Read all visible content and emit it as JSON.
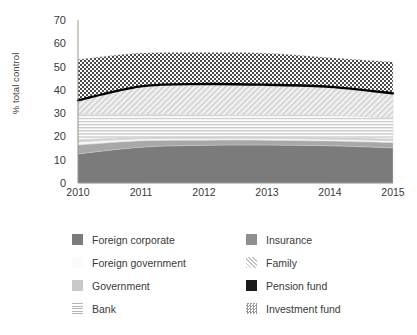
{
  "chart_data": {
    "type": "area",
    "stacked": true,
    "title": "",
    "xlabel": "",
    "ylabel": "% total control",
    "x": [
      2010,
      2011,
      2012,
      2013,
      2014,
      2015
    ],
    "xtick_labels": [
      "2010",
      "2011",
      "2012",
      "2013",
      "2014",
      "2015"
    ],
    "ytick_labels": [
      "0",
      "10",
      "20",
      "30",
      "40",
      "50",
      "60",
      "70"
    ],
    "yticks": [
      0,
      10,
      20,
      30,
      40,
      50,
      60,
      70
    ],
    "ylim": [
      0,
      70
    ],
    "xlim": [
      2010,
      2015
    ],
    "grid": false,
    "legend_position": "bottom",
    "series": [
      {
        "name": "Foreign corporate",
        "values": [
          12.5,
          15.4,
          16.2,
          16.3,
          16.0,
          15.1
        ],
        "swatch": "solid-dark-gray",
        "color": "#7b7b7b"
      },
      {
        "name": "Insurance",
        "values": [
          3.8,
          2.7,
          2.2,
          2.1,
          2.0,
          2.2
        ],
        "swatch": "solid-mid-gray",
        "color": "#a8a8a8"
      },
      {
        "name": "Foreign government",
        "values": [
          1.4,
          0.9,
          0.8,
          0.8,
          0.8,
          0.9
        ],
        "swatch": "solid-near-white",
        "color": "#f4f4f4"
      },
      {
        "name": "Government",
        "values": [
          0.9,
          0.7,
          0.7,
          0.7,
          0.7,
          0.7
        ],
        "swatch": "solid-light-gray",
        "color": "#cfcfcf"
      },
      {
        "name": "Bank",
        "values": [
          10.9,
          9.8,
          9.3,
          9.2,
          9.6,
          9.1
        ],
        "swatch": "horizontal-lines",
        "color": "#d8d8d8"
      },
      {
        "name": "Family",
        "values": [
          6.0,
          12.0,
          13.3,
          13.4,
          12.4,
          10.5
        ],
        "swatch": "diagonal-hatch",
        "color": "#e2e2e2"
      },
      {
        "name": "Investment fund",
        "values": [
          17.5,
          14.3,
          13.5,
          13.2,
          12.3,
          13.5
        ],
        "swatch": "checkerboard",
        "color": "#555555"
      }
    ],
    "overlay_line": {
      "name": "Pension fund",
      "values": [
        35.5,
        41.5,
        42.5,
        42.2,
        41.3,
        38.5
      ],
      "swatch": "solid-black",
      "color": "#000000",
      "line_width": 2.4
    },
    "stack_top": [
      53.0,
      55.8,
      56.0,
      55.4,
      53.8,
      52.0
    ]
  },
  "legend": {
    "columns": [
      {
        "items": [
          {
            "label": "Foreign corporate",
            "swatch": "solid-dark-gray"
          },
          {
            "label": "Foreign government",
            "swatch": "solid-near-white"
          },
          {
            "label": "Government",
            "swatch": "solid-light-gray"
          },
          {
            "label": "Bank",
            "swatch": "horizontal-lines"
          }
        ]
      },
      {
        "items": [
          {
            "label": "Insurance",
            "swatch": "solid-mid-gray"
          },
          {
            "label": "Family",
            "swatch": "diagonal-hatch"
          },
          {
            "label": "Pension fund",
            "swatch": "solid-black"
          },
          {
            "label": "Investment fund",
            "swatch": "checkerboard"
          }
        ]
      }
    ]
  }
}
